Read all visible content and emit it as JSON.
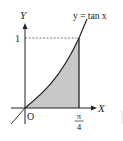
{
  "diagram": {
    "curve_label": "y = tan x",
    "axis_x_label": "X",
    "axis_y_label": "Y",
    "origin_label": "O",
    "y_tick_label": "1",
    "x_tick_numerator": "π",
    "x_tick_denominator": "4",
    "colors": {
      "line": "#222222",
      "fill": "#c8c8c8",
      "dash": "#555555",
      "background": "#ffffff"
    },
    "geometry": {
      "origin_px": [
        25,
        108
      ],
      "x_tick_px": 79,
      "y_tick_px": 38
    },
    "shaded_region": "0 ≤ x ≤ π/4, 0 ≤ y ≤ tan x"
  }
}
